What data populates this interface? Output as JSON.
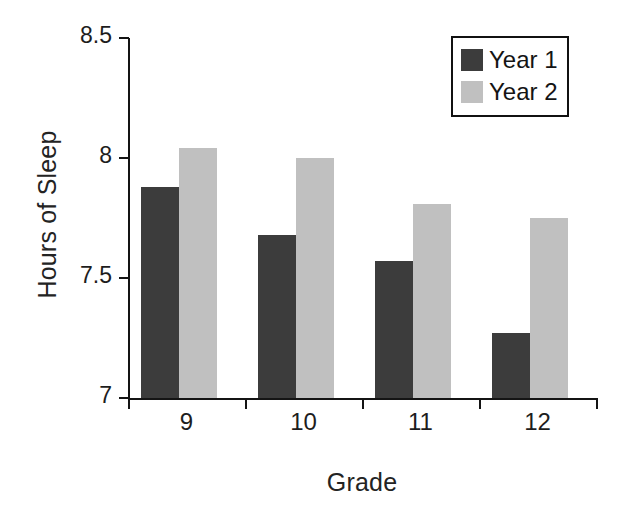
{
  "chart_data": {
    "type": "bar",
    "title": "",
    "xlabel": "Grade",
    "ylabel": "Hours of Sleep",
    "categories": [
      "9",
      "10",
      "11",
      "12"
    ],
    "series": [
      {
        "name": "Year 1",
        "color": "#3c3c3c",
        "values": [
          7.88,
          7.68,
          7.57,
          7.27
        ]
      },
      {
        "name": "Year 2",
        "color": "#c0c0c0",
        "values": [
          8.04,
          8.0,
          7.81,
          7.75
        ]
      }
    ],
    "ylim": [
      7,
      8.5
    ],
    "yticks": [
      7,
      7.5,
      8,
      8.5
    ],
    "ytick_labels": [
      "7",
      "7.5",
      "8",
      "8.5"
    ],
    "grid": false,
    "legend_position": "top-right",
    "legend_entries": [
      "Year 1",
      "Year 2"
    ],
    "background": "#ffffff",
    "axis_color": "#141414"
  }
}
